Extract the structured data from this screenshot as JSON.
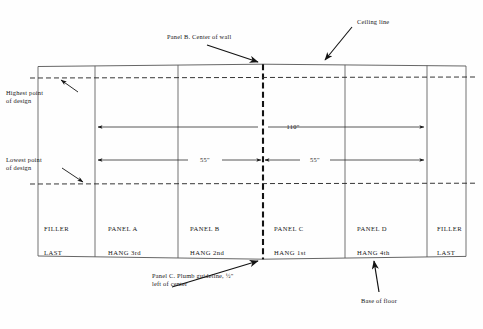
{
  "diagram": {
    "colors": {
      "ink": "#171717",
      "line": "#4a4a4a",
      "paper": "#fefefe"
    },
    "annotations": {
      "ceiling_line": "Ceiling line",
      "panel_b_center": "Panel B. Center of wall",
      "highest_point": "Highest point\nof design",
      "lowest_point": "Lowest point\nof design",
      "plumb_guideline": "Panel C. Plumb guideline, ½\"\nleft of center",
      "base_of_floor": "Base of floor"
    },
    "dimensions": [
      {
        "name": "full-width",
        "label": "110\""
      },
      {
        "name": "left-half",
        "label": "55\""
      },
      {
        "name": "right-half",
        "label": "55\""
      }
    ],
    "panels": [
      {
        "name": "filler-left",
        "line1": "FILLER",
        "line2": "LAST"
      },
      {
        "name": "panel-a",
        "line1": "PANEL A",
        "line2": "HANG 3rd"
      },
      {
        "name": "panel-b",
        "line1": "PANEL B",
        "line2": "HANG 2nd"
      },
      {
        "name": "panel-c",
        "line1": "PANEL C",
        "line2": "HANG 1st"
      },
      {
        "name": "panel-d",
        "line1": "PANEL D",
        "line2": "HANG 4th"
      },
      {
        "name": "filler-right",
        "line1": "FILLER",
        "line2": "LAST"
      }
    ]
  }
}
